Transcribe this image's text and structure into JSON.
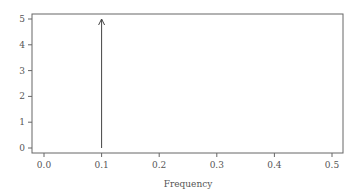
{
  "chart_data": {
    "type": "line",
    "title": "",
    "xlabel": "Frequency",
    "ylabel": "",
    "xlim": [
      -0.02,
      0.52
    ],
    "ylim": [
      -0.2,
      5.2
    ],
    "x_ticks": [
      0.0,
      0.1,
      0.2,
      0.3,
      0.4,
      0.5
    ],
    "x_tick_labels": [
      "0.0",
      "0.1",
      "0.2",
      "0.3",
      "0.4",
      "0.5"
    ],
    "y_ticks": [
      0,
      1,
      2,
      3,
      4,
      5
    ],
    "y_tick_labels": [
      "0",
      "1",
      "2",
      "3",
      "4",
      "5"
    ],
    "grid": false,
    "series": [
      {
        "name": "spectral line",
        "x": [
          0.1,
          0.1
        ],
        "y": [
          0,
          5
        ],
        "style": "arrow"
      }
    ]
  },
  "colors": {
    "axis": "#555555",
    "line": "#444444"
  }
}
